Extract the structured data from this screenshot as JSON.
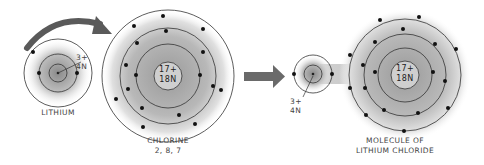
{
  "labels": {
    "lithium": "LITHIUM",
    "chlorine": "CHLORINE",
    "chlorine_config": "2, 8, 7",
    "molecule_line1": "MOLECULE OF",
    "molecule_line2": "LITHIUM CHLORIDE",
    "li_charge": "3+",
    "li_neutrons": "4N",
    "cl_charge": "17+",
    "cl_neutrons": "18N",
    "mol_li_charge": "3+",
    "mol_li_neutrons": "4N",
    "mol_cl_charge": "17+",
    "mol_cl_neutrons": "18N"
  },
  "colors": {
    "line": "#333333",
    "electron": "#111111",
    "arrow": "#666666",
    "shade": "#9a9a9a"
  }
}
